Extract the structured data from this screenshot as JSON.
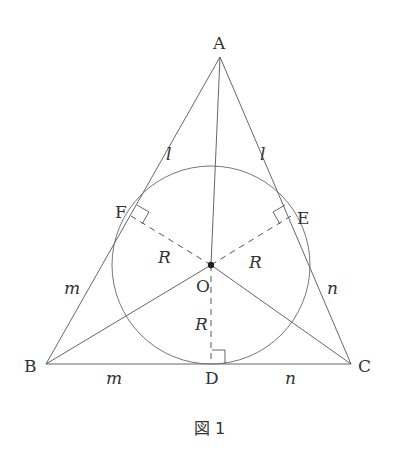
{
  "figure": {
    "caption": "図 1",
    "points": {
      "A": {
        "label": "A",
        "x": 220,
        "y": 57
      },
      "B": {
        "label": "B",
        "x": 46,
        "y": 364
      },
      "C": {
        "label": "C",
        "x": 351,
        "y": 364
      },
      "O": {
        "label": "O",
        "x": 211,
        "y": 265
      },
      "D": {
        "label": "D",
        "x": 212,
        "y": 364
      },
      "E": {
        "label": "E",
        "x": 291,
        "y": 216
      },
      "F": {
        "label": "F",
        "x": 131,
        "y": 216
      }
    },
    "incircle": {
      "cx": 211,
      "cy": 265,
      "r": 99
    },
    "segment_labels": {
      "AF": "l",
      "AE": "l",
      "BF": "m",
      "BD": "m",
      "CE": "n",
      "CD": "n",
      "OF": "R",
      "OE": "R",
      "OD": "R"
    },
    "colors": {
      "line": "#555555",
      "text": "#333333",
      "background": "#ffffff"
    }
  }
}
